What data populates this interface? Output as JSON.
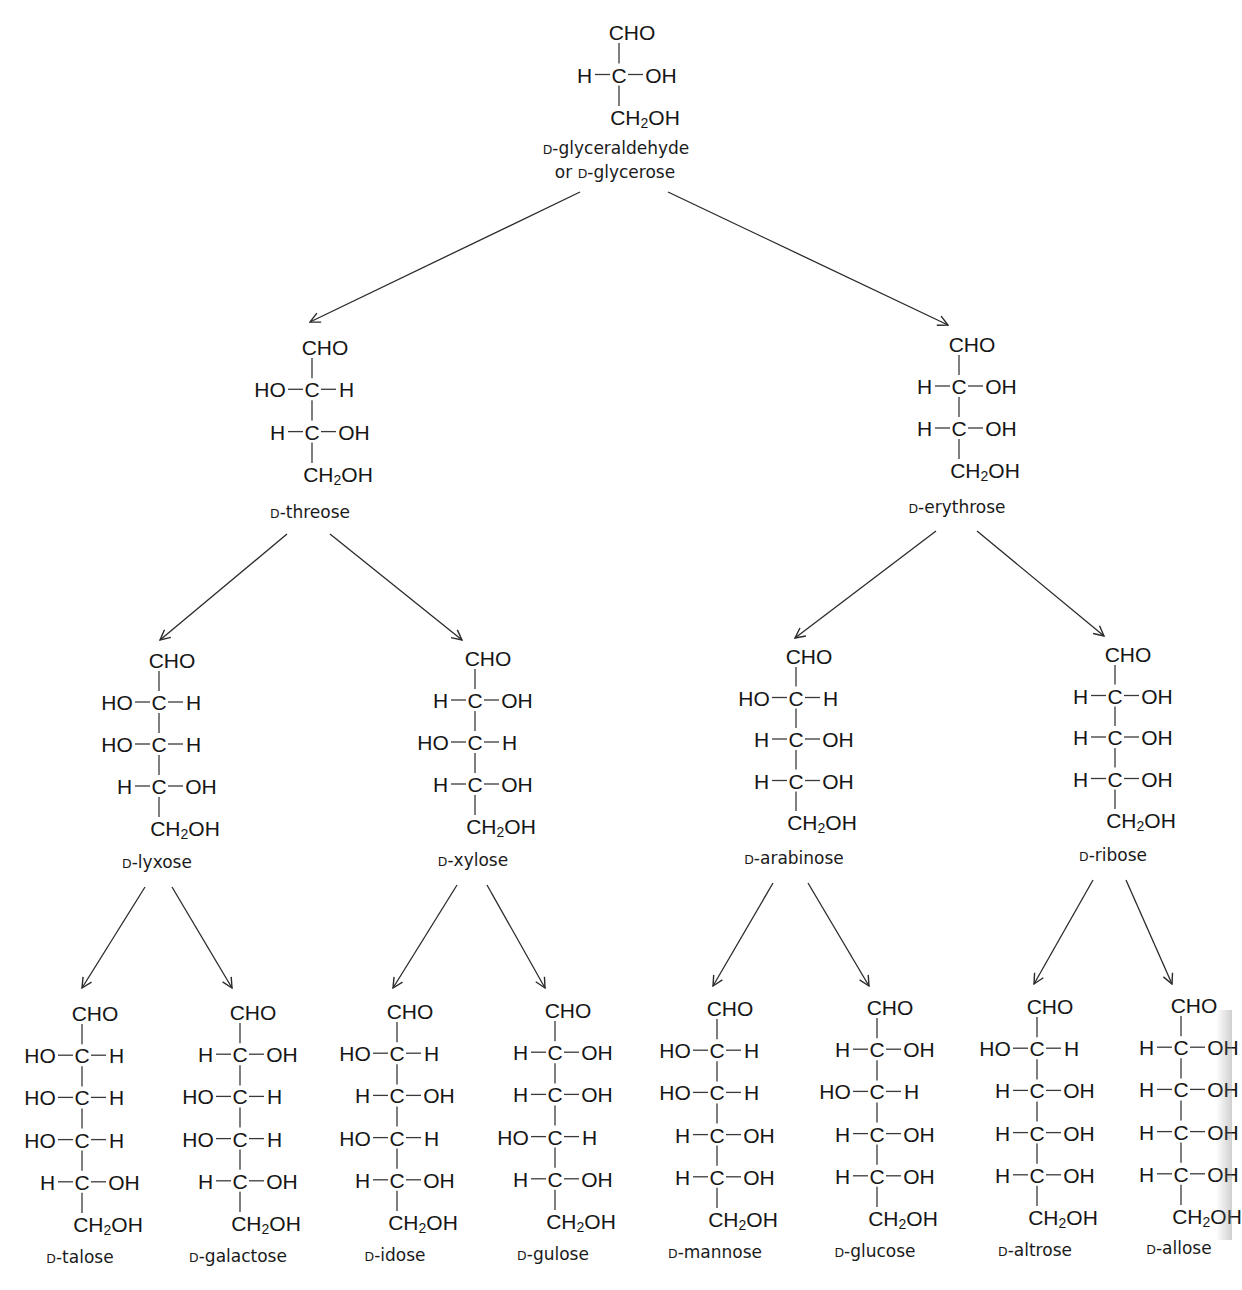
{
  "colors": {
    "ink": "#161616",
    "background": "#ffffff",
    "line": "#2a2a2a"
  },
  "root": {
    "id": "glyceraldehyde",
    "label_lines": [
      "D-glyceraldehyde",
      "or D-glycerose"
    ],
    "label_prefix": "D",
    "label_names": [
      "-glyceraldehyde",
      "-glycerose"
    ],
    "label_or": "or ",
    "top": "CHO",
    "rows": [
      [
        "H",
        "OH"
      ]
    ],
    "bottom": "CH2OH"
  },
  "tetroses": [
    {
      "id": "threose",
      "name": "-threose",
      "prefix": "D",
      "top": "CHO",
      "rows": [
        [
          "HO",
          "H"
        ],
        [
          "H",
          "OH"
        ]
      ],
      "bottom": "CH2OH"
    },
    {
      "id": "erythrose",
      "name": "-erythrose",
      "prefix": "D",
      "top": "CHO",
      "rows": [
        [
          "H",
          "OH"
        ],
        [
          "H",
          "OH"
        ]
      ],
      "bottom": "CH2OH"
    }
  ],
  "pentoses": [
    {
      "id": "lyxose",
      "name": "-lyxose",
      "prefix": "D",
      "top": "CHO",
      "rows": [
        [
          "HO",
          "H"
        ],
        [
          "HO",
          "H"
        ],
        [
          "H",
          "OH"
        ]
      ],
      "bottom": "CH2OH"
    },
    {
      "id": "xylose",
      "name": "-xylose",
      "prefix": "D",
      "top": "CHO",
      "rows": [
        [
          "H",
          "OH"
        ],
        [
          "HO",
          "H"
        ],
        [
          "H",
          "OH"
        ]
      ],
      "bottom": "CH2OH"
    },
    {
      "id": "arabinose",
      "name": "-arabinose",
      "prefix": "D",
      "top": "CHO",
      "rows": [
        [
          "HO",
          "H"
        ],
        [
          "H",
          "OH"
        ],
        [
          "H",
          "OH"
        ]
      ],
      "bottom": "CH2OH"
    },
    {
      "id": "ribose",
      "name": "-ribose",
      "prefix": "D",
      "top": "CHO",
      "rows": [
        [
          "H",
          "OH"
        ],
        [
          "H",
          "OH"
        ],
        [
          "H",
          "OH"
        ]
      ],
      "bottom": "CH2OH"
    }
  ],
  "hexoses": [
    {
      "id": "talose",
      "name": "-talose",
      "prefix": "D",
      "top": "CHO",
      "rows": [
        [
          "HO",
          "H"
        ],
        [
          "HO",
          "H"
        ],
        [
          "HO",
          "H"
        ],
        [
          "H",
          "OH"
        ]
      ],
      "bottom": "CH2OH"
    },
    {
      "id": "galactose",
      "name": "-galactose",
      "prefix": "D",
      "top": "CHO",
      "rows": [
        [
          "H",
          "OH"
        ],
        [
          "HO",
          "H"
        ],
        [
          "HO",
          "H"
        ],
        [
          "H",
          "OH"
        ]
      ],
      "bottom": "CH2OH"
    },
    {
      "id": "idose",
      "name": "-idose",
      "prefix": "D",
      "top": "CHO",
      "rows": [
        [
          "HO",
          "H"
        ],
        [
          "H",
          "OH"
        ],
        [
          "HO",
          "H"
        ],
        [
          "H",
          "OH"
        ]
      ],
      "bottom": "CH2OH"
    },
    {
      "id": "gulose",
      "name": "-gulose",
      "prefix": "D",
      "top": "CHO",
      "rows": [
        [
          "H",
          "OH"
        ],
        [
          "H",
          "OH"
        ],
        [
          "HO",
          "H"
        ],
        [
          "H",
          "OH"
        ]
      ],
      "bottom": "CH2OH"
    },
    {
      "id": "mannose",
      "name": "-mannose",
      "prefix": "D",
      "top": "CHO",
      "rows": [
        [
          "HO",
          "H"
        ],
        [
          "HO",
          "H"
        ],
        [
          "H",
          "OH"
        ],
        [
          "H",
          "OH"
        ]
      ],
      "bottom": "CH2OH"
    },
    {
      "id": "glucose",
      "name": "-glucose",
      "prefix": "D",
      "top": "CHO",
      "rows": [
        [
          "H",
          "OH"
        ],
        [
          "HO",
          "H"
        ],
        [
          "H",
          "OH"
        ],
        [
          "H",
          "OH"
        ]
      ],
      "bottom": "CH2OH"
    },
    {
      "id": "altrose",
      "name": "-altrose",
      "prefix": "D",
      "top": "CHO",
      "rows": [
        [
          "HO",
          "H"
        ],
        [
          "H",
          "OH"
        ],
        [
          "H",
          "OH"
        ],
        [
          "H",
          "OH"
        ]
      ],
      "bottom": "CH2OH"
    },
    {
      "id": "allose",
      "name": "-allose",
      "prefix": "D",
      "top": "CHO",
      "rows": [
        [
          "H",
          "OH"
        ],
        [
          "H",
          "OH"
        ],
        [
          "H",
          "OH"
        ],
        [
          "H",
          "OH"
        ]
      ],
      "bottom": "CH2OH"
    }
  ],
  "edges": [
    [
      "glyceraldehyde",
      "threose"
    ],
    [
      "glyceraldehyde",
      "erythrose"
    ],
    [
      "threose",
      "lyxose"
    ],
    [
      "threose",
      "xylose"
    ],
    [
      "erythrose",
      "arabinose"
    ],
    [
      "erythrose",
      "ribose"
    ],
    [
      "lyxose",
      "talose"
    ],
    [
      "lyxose",
      "galactose"
    ],
    [
      "xylose",
      "idose"
    ],
    [
      "xylose",
      "gulose"
    ],
    [
      "arabinose",
      "mannose"
    ],
    [
      "arabinose",
      "glucose"
    ],
    [
      "ribose",
      "altrose"
    ],
    [
      "ribose",
      "allose"
    ]
  ]
}
